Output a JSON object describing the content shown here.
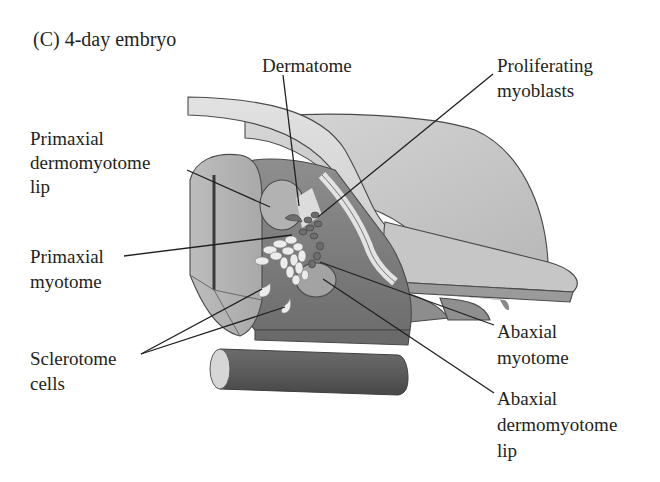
{
  "figure": {
    "panel_title": "(C)  4-day embryo",
    "labels": {
      "dermatome": "Dermatome",
      "proliferating_myoblasts": [
        "Proliferating",
        "myoblasts"
      ],
      "primaxial_dermomyotome_lip": [
        "Primaxial",
        "dermomyotome",
        "lip"
      ],
      "primaxial_myotome": [
        "Primaxial",
        "myotome"
      ],
      "sclerotome_cells": [
        "Sclerotome",
        "cells"
      ],
      "abaxial_myotome": [
        "Abaxial",
        "myotome"
      ],
      "abaxial_dermomyotome_lip": [
        "Abaxial",
        "dermomyotome",
        "lip"
      ]
    }
  }
}
